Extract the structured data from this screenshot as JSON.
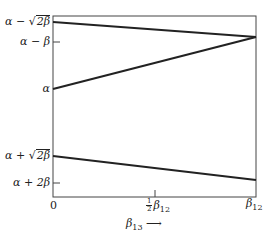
{
  "diagram": {
    "type": "line-diagram",
    "colors": {
      "line": "#222222",
      "frame": "#444444",
      "background": "#ffffff"
    },
    "frame": {
      "x0": 53,
      "y0": 16,
      "x1": 256,
      "y1": 197
    },
    "y_axis": {
      "labels": [
        {
          "id": "alpha-minus-sqrt2beta",
          "prefix": "α − ",
          "sqrt": "2β",
          "y": 22
        },
        {
          "id": "alpha-minus-beta",
          "text": "α − β",
          "y": 42,
          "tick": true
        },
        {
          "id": "alpha",
          "text": "α",
          "y": 89
        },
        {
          "id": "alpha-plus-sqrt2beta",
          "prefix": "α + ",
          "sqrt": "2β",
          "y": 156
        },
        {
          "id": "alpha-plus-2beta",
          "text": "α + 2β",
          "y": 183,
          "tick": true
        }
      ]
    },
    "x_axis": {
      "labels": [
        {
          "id": "zero",
          "text": "0",
          "x": 53
        },
        {
          "id": "half-beta12",
          "frac_num": "1",
          "frac_den": "2",
          "sym": "β",
          "sub": "12",
          "x": 155,
          "tick": true
        },
        {
          "id": "beta12",
          "sym": "β",
          "sub": "12",
          "x": 256
        }
      ],
      "variable": {
        "sym": "β",
        "sub": "13",
        "arrow": "⟶"
      }
    },
    "lines": [
      {
        "id": "line-top",
        "from": [
          53,
          22
        ],
        "to": [
          256,
          37
        ]
      },
      {
        "id": "line-alpha",
        "from": [
          53,
          89
        ],
        "to": [
          256,
          37
        ]
      },
      {
        "id": "line-bottom",
        "from": [
          53,
          156
        ],
        "to": [
          256,
          180
        ]
      }
    ]
  }
}
